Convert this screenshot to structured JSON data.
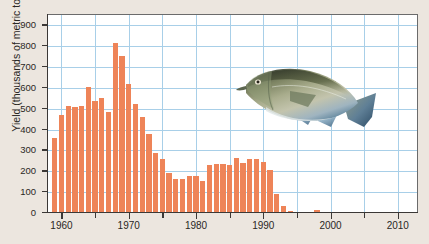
{
  "chart_data": {
    "type": "bar",
    "title": "",
    "xlabel": "",
    "ylabel": "Yield (thousands of metric tons)",
    "xlim": [
      1958,
      2013
    ],
    "ylim": [
      0,
      950
    ],
    "grid": true,
    "legend": null,
    "bar_color": "#ee8458",
    "grid_color": "#a8cfe8",
    "y_ticks": [
      0,
      100,
      200,
      300,
      400,
      500,
      600,
      700,
      800,
      900
    ],
    "y_tick_labels": [
      "0",
      "100",
      "200",
      "300",
      "400",
      "500",
      "600",
      "700",
      "800",
      "900"
    ],
    "x_ticks": [
      1960,
      1965,
      1970,
      1975,
      1980,
      1985,
      1990,
      1995,
      2000,
      2005,
      2010
    ],
    "x_tick_labels": [
      "1960",
      "",
      "1970",
      "",
      "1980",
      "",
      "1990",
      "",
      "2000",
      "",
      "2010"
    ],
    "x_major_labels": [
      "1960",
      "1970",
      "1980",
      "1990",
      "2000",
      "2010"
    ],
    "categories": [
      1959,
      1960,
      1961,
      1962,
      1963,
      1964,
      1965,
      1966,
      1967,
      1968,
      1969,
      1970,
      1971,
      1972,
      1973,
      1974,
      1975,
      1976,
      1977,
      1978,
      1979,
      1980,
      1981,
      1982,
      1983,
      1984,
      1985,
      1986,
      1987,
      1988,
      1989,
      1990,
      1991,
      1992,
      1993,
      1994,
      1995,
      1996,
      1997,
      1998,
      1999,
      2000,
      2001,
      2002,
      2003,
      2004,
      2005,
      2006,
      2007,
      2008,
      2009,
      2010,
      2011,
      2012
    ],
    "values": [
      355,
      465,
      510,
      505,
      508,
      600,
      535,
      545,
      480,
      810,
      750,
      615,
      520,
      455,
      375,
      285,
      255,
      185,
      160,
      160,
      175,
      172,
      150,
      225,
      230,
      230,
      225,
      260,
      235,
      255,
      255,
      240,
      200,
      85,
      30,
      5,
      0,
      0,
      0,
      8,
      0,
      0,
      0,
      0,
      0,
      0,
      0,
      0,
      0,
      0,
      0,
      0,
      0,
      0
    ],
    "annotations": [
      {
        "type": "image",
        "name": "cod-fish-illustration",
        "label": "Atlantic cod"
      }
    ]
  },
  "figure": {
    "caption": "",
    "fish_label": "cod-fish-illustration"
  }
}
